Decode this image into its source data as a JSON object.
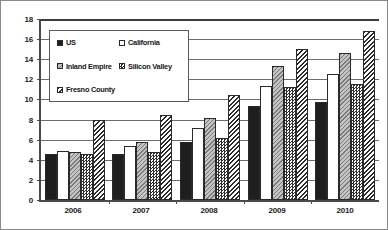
{
  "chart_data": {
    "type": "bar",
    "title": "",
    "xlabel": "",
    "ylabel": "",
    "ylim": [
      0,
      18
    ],
    "ytick_step": 2,
    "yticks": [
      0,
      2,
      4,
      6,
      8,
      10,
      12,
      14,
      16,
      18
    ],
    "grid": true,
    "legend_position": "upper-left-inside",
    "categories": [
      "2006",
      "2007",
      "2008",
      "2009",
      "2010"
    ],
    "series": [
      {
        "name": "US",
        "key": "us",
        "pattern": "solid-black",
        "swatch_color": "#1e1e1e",
        "values": [
          4.6,
          4.6,
          5.8,
          9.3,
          9.7
        ]
      },
      {
        "name": "California",
        "key": "ca",
        "pattern": "empty-white",
        "swatch_color": "#ffffff",
        "values": [
          4.9,
          5.4,
          7.2,
          11.3,
          12.5
        ]
      },
      {
        "name": "Inland Empire",
        "key": "ie",
        "pattern": "light-gray-hatch",
        "swatch_color": "#c4c4c4",
        "values": [
          4.8,
          5.8,
          8.2,
          13.3,
          14.6
        ]
      },
      {
        "name": "Silicon Valley",
        "key": "sv",
        "pattern": "checkerboard",
        "swatch_color": "#9a9a9a",
        "values": [
          4.6,
          4.8,
          6.2,
          11.2,
          11.5
        ]
      },
      {
        "name": "Fresno County",
        "key": "fc",
        "pattern": "diagonal-hatch",
        "swatch_color": "#6f6f6f",
        "values": [
          8.0,
          8.5,
          10.4,
          15.0,
          16.8
        ]
      }
    ]
  }
}
